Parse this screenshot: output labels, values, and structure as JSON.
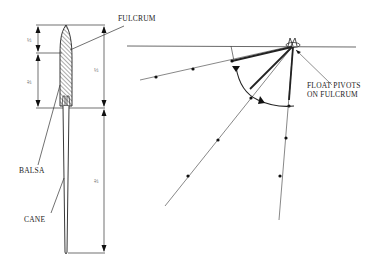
{
  "diagram": {
    "type": "technical-illustration",
    "left_figure": {
      "labels": {
        "fulcrum": "FULCRUM",
        "balsa": "BALSA",
        "cane": "CANE"
      },
      "dimensions": {
        "left_upper": "⅓",
        "left_lower": "⅔",
        "right_upper": "⅓",
        "right_lower": "⅔"
      }
    },
    "right_figure": {
      "labels": {
        "pivot_line1": "FLOAT PIVOTS",
        "pivot_line2": "ON FULCRUM"
      },
      "line_positions": 3
    },
    "colors": {
      "ink": "#222222",
      "hatch": "#444444",
      "background": "#ffffff"
    }
  }
}
